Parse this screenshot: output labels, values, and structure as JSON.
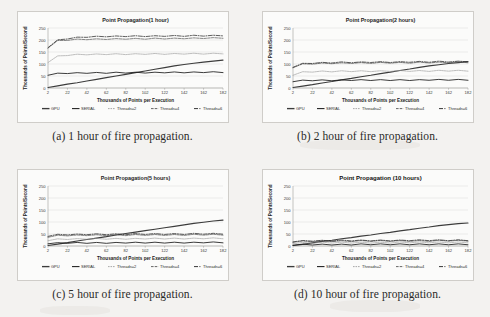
{
  "figure": {
    "background_color": "#f3f2f0",
    "panel_color": "#fbfbfa",
    "series_colors": {
      "GPU": "#3c3c3c",
      "SERIAL": "#1a1a1a",
      "Threads=2": "#9a9a9a",
      "Threads=4": "#555555",
      "Threads=6": "#2b2b2b"
    }
  },
  "subfigures": [
    {
      "id": "a",
      "caption": "(a) 1 hour of fire propagation."
    },
    {
      "id": "b",
      "caption": "(b) 2 hour of fire propagation."
    },
    {
      "id": "c",
      "caption": "(c) 5 hour of fire propagation."
    },
    {
      "id": "d",
      "caption": "(d) 10 hour of fire propagation."
    }
  ],
  "legend_labels": [
    "GPU",
    "SERIAL",
    "Threads=2",
    "Threads=4",
    "Threads=6"
  ],
  "chart_data": [
    {
      "type": "line",
      "title": "Point Propagation(1 hour)",
      "xlabel": "Thousands  of Points per Execution",
      "ylabel": "Thousands  of Points/Second",
      "xlim": [
        2,
        182
      ],
      "ylim": [
        0,
        250
      ],
      "xticks": [
        2,
        22,
        42,
        62,
        82,
        102,
        122,
        142,
        162,
        182
      ],
      "yticks": [
        0,
        50,
        100,
        150,
        200,
        250
      ],
      "grid": true,
      "legend_position": "bottom",
      "x": [
        2,
        12,
        22,
        32,
        42,
        52,
        62,
        72,
        82,
        92,
        102,
        112,
        122,
        132,
        142,
        152,
        162,
        172,
        182
      ],
      "series": [
        {
          "name": "GPU",
          "values": [
            2,
            9,
            16,
            22,
            29,
            36,
            43,
            50,
            57,
            64,
            71,
            78,
            85,
            92,
            98,
            103,
            108,
            112,
            116
          ]
        },
        {
          "name": "SERIAL",
          "values": [
            55,
            60,
            62,
            62,
            63,
            63,
            63,
            64,
            64,
            64,
            64,
            64,
            65,
            65,
            65,
            65,
            66,
            66,
            66
          ]
        },
        {
          "name": "Threads=2",
          "values": [
            108,
            132,
            137,
            139,
            140,
            140,
            141,
            141,
            141,
            141,
            142,
            142,
            142,
            142,
            143,
            143,
            143,
            143,
            144
          ]
        },
        {
          "name": "Threads=4",
          "values": [
            168,
            196,
            200,
            202,
            203,
            203,
            204,
            204,
            205,
            205,
            205,
            206,
            206,
            206,
            207,
            207,
            208,
            208,
            209
          ]
        },
        {
          "name": "Threads=6",
          "values": [
            170,
            199,
            206,
            210,
            213,
            214,
            215,
            215,
            216,
            216,
            216,
            216,
            217,
            217,
            217,
            218,
            218,
            218,
            219
          ]
        }
      ]
    },
    {
      "type": "line",
      "title": "Point Propagation(2 hours)",
      "xlabel": "Thousands  of Points per Execution",
      "ylabel": "Thousands  of Points/Second",
      "xlim": [
        2,
        182
      ],
      "ylim": [
        0,
        250
      ],
      "xticks": [
        2,
        22,
        42,
        62,
        82,
        102,
        122,
        142,
        162,
        182
      ],
      "yticks": [
        0,
        50,
        100,
        150,
        200,
        250
      ],
      "grid": true,
      "legend_position": "bottom",
      "x": [
        2,
        12,
        22,
        32,
        42,
        52,
        62,
        72,
        82,
        92,
        102,
        112,
        122,
        132,
        142,
        152,
        162,
        172,
        182
      ],
      "series": [
        {
          "name": "GPU",
          "values": [
            2,
            8,
            14,
            21,
            27,
            34,
            40,
            47,
            53,
            60,
            66,
            73,
            79,
            86,
            92,
            97,
            102,
            106,
            110
          ]
        },
        {
          "name": "SERIAL",
          "values": [
            28,
            31,
            32,
            32,
            32,
            32,
            33,
            33,
            33,
            33,
            33,
            33,
            33,
            33,
            34,
            34,
            34,
            34,
            34
          ]
        },
        {
          "name": "Threads=2",
          "values": [
            55,
            66,
            68,
            69,
            69,
            70,
            70,
            70,
            70,
            70,
            71,
            71,
            71,
            71,
            71,
            72,
            72,
            72,
            72
          ]
        },
        {
          "name": "Threads=4",
          "values": [
            86,
            99,
            101,
            102,
            103,
            103,
            104,
            104,
            104,
            105,
            105,
            105,
            105,
            106,
            106,
            106,
            107,
            107,
            107
          ]
        },
        {
          "name": "Threads=6",
          "values": [
            88,
            101,
            104,
            105,
            106,
            107,
            107,
            107,
            108,
            108,
            108,
            108,
            109,
            109,
            109,
            110,
            110,
            110,
            111
          ]
        }
      ]
    },
    {
      "type": "line",
      "title": "Point Propagation(5 hours)",
      "xlabel": "Thousands  of Points per Execution",
      "ylabel": "Thousands  of Points/Second",
      "xlim": [
        2,
        182
      ],
      "ylim": [
        0,
        250
      ],
      "xticks": [
        2,
        22,
        42,
        62,
        82,
        102,
        122,
        142,
        162,
        182
      ],
      "yticks": [
        0,
        50,
        100,
        150,
        200,
        250
      ],
      "grid": true,
      "legend_position": "bottom",
      "x": [
        2,
        12,
        22,
        32,
        42,
        52,
        62,
        72,
        82,
        92,
        102,
        112,
        122,
        132,
        142,
        152,
        162,
        172,
        182
      ],
      "series": [
        {
          "name": "GPU",
          "values": [
            2,
            8,
            14,
            21,
            27,
            33,
            39,
            46,
            52,
            58,
            64,
            70,
            76,
            82,
            88,
            94,
            99,
            104,
            108
          ]
        },
        {
          "name": "SERIAL",
          "values": [
            11,
            12,
            13,
            13,
            13,
            13,
            13,
            13,
            14,
            14,
            14,
            14,
            14,
            14,
            14,
            14,
            15,
            15,
            15
          ]
        },
        {
          "name": "Threads=2",
          "values": [
            24,
            28,
            29,
            29,
            30,
            30,
            30,
            30,
            30,
            30,
            31,
            31,
            31,
            31,
            31,
            31,
            32,
            32,
            32
          ]
        },
        {
          "name": "Threads=4",
          "values": [
            38,
            43,
            44,
            44,
            45,
            45,
            45,
            45,
            45,
            46,
            46,
            46,
            46,
            46,
            46,
            47,
            47,
            47,
            47
          ]
        },
        {
          "name": "Threads=6",
          "values": [
            42,
            47,
            48,
            48,
            49,
            49,
            49,
            49,
            49,
            50,
            50,
            50,
            50,
            50,
            50,
            51,
            51,
            51,
            51
          ]
        }
      ]
    },
    {
      "type": "line",
      "title": "Point Propagation (10 hours)",
      "xlabel": "Thousands  of Points per Execution",
      "ylabel": "Thousands  of Points/Second",
      "xlim": [
        2,
        182
      ],
      "ylim": [
        0,
        250
      ],
      "xticks": [
        2,
        22,
        42,
        62,
        82,
        102,
        122,
        142,
        162,
        182
      ],
      "yticks": [
        0,
        50,
        100,
        150,
        200,
        250
      ],
      "grid": true,
      "legend_position": "bottom",
      "x": [
        2,
        12,
        22,
        32,
        42,
        52,
        62,
        72,
        82,
        92,
        102,
        112,
        122,
        132,
        142,
        152,
        162,
        172,
        182
      ],
      "series": [
        {
          "name": "GPU",
          "values": [
            2,
            7,
            13,
            19,
            24,
            30,
            35,
            41,
            46,
            52,
            57,
            63,
            68,
            74,
            79,
            85,
            89,
            93,
            96
          ]
        },
        {
          "name": "SERIAL",
          "values": [
            5,
            6,
            6,
            6,
            6,
            6,
            6,
            7,
            7,
            7,
            7,
            7,
            7,
            7,
            7,
            7,
            7,
            7,
            7
          ]
        },
        {
          "name": "Threads=2",
          "values": [
            11,
            13,
            13,
            14,
            14,
            14,
            14,
            14,
            14,
            14,
            14,
            15,
            15,
            15,
            15,
            15,
            15,
            15,
            15
          ]
        },
        {
          "name": "Threads=4",
          "values": [
            17,
            19,
            20,
            20,
            20,
            20,
            20,
            21,
            21,
            21,
            21,
            21,
            21,
            21,
            21,
            22,
            22,
            22,
            22
          ]
        },
        {
          "name": "Threads=6",
          "values": [
            19,
            21,
            22,
            22,
            22,
            23,
            23,
            23,
            23,
            23,
            23,
            23,
            24,
            24,
            24,
            24,
            24,
            24,
            24
          ]
        }
      ]
    }
  ]
}
